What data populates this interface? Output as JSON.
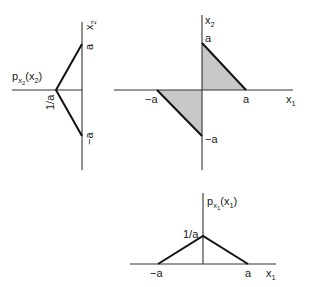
{
  "diagram": {
    "type": "joint and marginal probability density sketch",
    "colors": {
      "line": "#111111",
      "axis": "#333333",
      "shade": "#c8c8c8",
      "background": "#ffffff"
    },
    "left_panel": {
      "title_main": "p",
      "title_sub": "x",
      "title_subsub": "2",
      "title_arg": "(x",
      "title_arg_sub": "2",
      "title_close": ")",
      "axis_label": "x",
      "axis_label_sub": "2",
      "peak_label": "1/a",
      "tick_top": "a",
      "tick_bottom": "−a"
    },
    "center_panel": {
      "x_axis_label": "x",
      "x_axis_label_sub": "1",
      "y_axis_label": "x",
      "y_axis_label_sub": "2",
      "tick_x_neg": "−a",
      "tick_x_pos": "a",
      "tick_y_pos": "a",
      "tick_y_neg": "−a"
    },
    "bottom_panel": {
      "title_main": "p",
      "title_sub": "x",
      "title_subsub": "1",
      "title_arg": "(x",
      "title_arg_sub": "1",
      "title_close": ")",
      "axis_label": "x",
      "axis_label_sub": "1",
      "peak_label": "1/a",
      "tick_neg": "−a",
      "tick_pos": "a"
    }
  }
}
